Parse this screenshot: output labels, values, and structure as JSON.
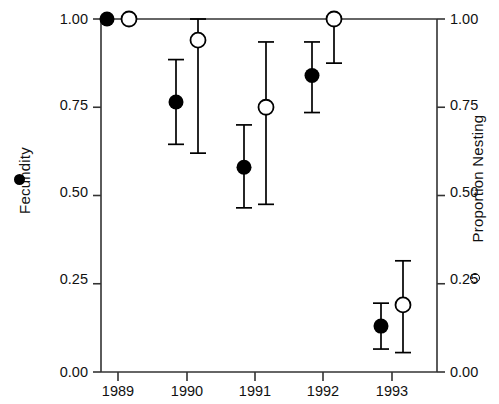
{
  "chart_data": {
    "type": "scatter",
    "title": "",
    "xlabel": "",
    "ylabel": "Fecundity",
    "ylabel_right": "Proportion Nesting",
    "categories": [
      "1989",
      "1990",
      "1991",
      "1992",
      "1993"
    ],
    "x": [
      1989,
      1990,
      1991,
      1992,
      1993
    ],
    "ylim": [
      0.0,
      1.0
    ],
    "ytick_labels": [
      "0.00",
      "0.25",
      "0.50",
      "0.75",
      "1.00"
    ],
    "ytick_values": [
      0.0,
      0.25,
      0.5,
      0.75,
      1.0
    ],
    "ytick_labels_right": [
      "0.00",
      "0.25",
      "0.50",
      "0.75",
      "1.00"
    ],
    "grid": false,
    "legend_position": "axis-labels",
    "series": [
      {
        "name": "Fecundity",
        "marker": "filled-circle",
        "axis": "left",
        "color": "#000000",
        "values": [
          1.0,
          0.765,
          0.58,
          0.84,
          0.13
        ],
        "err_low": [
          null,
          0.645,
          0.465,
          0.735,
          0.065
        ],
        "err_high": [
          null,
          0.885,
          0.7,
          0.935,
          0.195
        ]
      },
      {
        "name": "Proportion Nesting",
        "marker": "open-circle",
        "axis": "right",
        "color": "#000000",
        "values": [
          1.0,
          0.94,
          0.75,
          1.0,
          0.19
        ],
        "err_low": [
          null,
          0.62,
          0.475,
          0.875,
          0.055
        ],
        "err_high": [
          null,
          1.0,
          0.935,
          1.0,
          0.315
        ]
      }
    ]
  },
  "axes": {
    "left_title": "Fecundity",
    "right_title": "Proportion Nesting",
    "left_legend_icon": "filled-circle-icon",
    "right_legend_icon": "open-circle-icon"
  },
  "ticks": {
    "y_left": [
      {
        "label": "1.00",
        "top": 11
      },
      {
        "label": "0.75",
        "top": 97
      },
      {
        "label": "0.50",
        "top": 184
      },
      {
        "label": "0.25",
        "top": 271
      },
      {
        "label": "0.00",
        "top": 364
      }
    ],
    "y_right": [
      {
        "label": "1.00",
        "top": 11
      },
      {
        "label": "0.75",
        "top": 97
      },
      {
        "label": "0.50",
        "top": 184
      },
      {
        "label": "0.25",
        "top": 271
      },
      {
        "label": "0.00",
        "top": 364
      }
    ],
    "x": [
      {
        "label": "1989",
        "left": 88
      },
      {
        "label": "1990",
        "left": 157
      },
      {
        "label": "1991",
        "left": 225
      },
      {
        "label": "1992",
        "left": 293
      },
      {
        "label": "1993",
        "left": 362
      }
    ]
  }
}
